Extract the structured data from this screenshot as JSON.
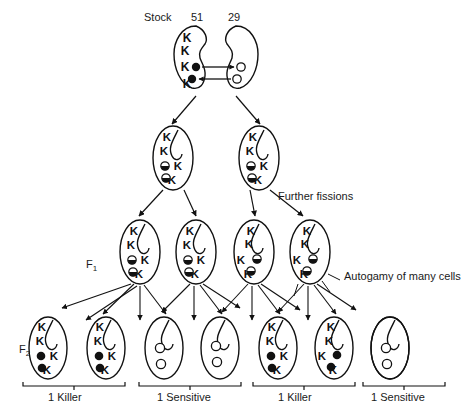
{
  "figure": {
    "type": "genetic-cross-diagram"
  },
  "header": {
    "stock_label": "Stock",
    "stock_left": "51",
    "stock_right": "29"
  },
  "annotations": {
    "further_fissions": "Further fissions",
    "autogamy": "Autogamy of many cells",
    "f1": "F",
    "f1_sub": "1",
    "f2": "F",
    "f2_sub": "2"
  },
  "symbols": {
    "gene": "K",
    "kappa_filled": "filled-circle",
    "kappa_open": "open-circle",
    "kappa_half": "half-filled-circle"
  },
  "generations": [
    {
      "name": "conjugating-pair",
      "row": "stock",
      "cells": [
        {
          "id": "stock-51",
          "side": "left",
          "stock": "51",
          "phenotype": "killer",
          "contents": [
            "K",
            "K",
            "K",
            "filled-circle",
            "filled-circle",
            "K"
          ]
        },
        {
          "id": "stock-29",
          "side": "right",
          "stock": "29",
          "phenotype": "sensitive",
          "contents": [
            "open-circle",
            "open-circle"
          ]
        }
      ],
      "exchange_arrows": [
        {
          "direction": "right",
          "from": "stock-51",
          "to": "stock-29"
        },
        {
          "direction": "left",
          "from": "stock-29",
          "to": "stock-51"
        }
      ]
    },
    {
      "name": "exconjugants",
      "row": "second",
      "cells": [
        {
          "id": "ex-left",
          "contents": [
            "K",
            "K",
            "half-filled-circle",
            "half-filled-circle",
            "K",
            "K"
          ]
        },
        {
          "id": "ex-right",
          "contents": [
            "K",
            "K",
            "half-filled-circle",
            "half-filled-circle",
            "K",
            "K"
          ]
        }
      ]
    },
    {
      "name": "f1",
      "row": "third",
      "cells": [
        {
          "id": "f1-1",
          "contents": [
            "K",
            "K",
            "half-filled-circle",
            "half-filled-circle",
            "K",
            "K"
          ]
        },
        {
          "id": "f1-2",
          "contents": [
            "K",
            "K",
            "half-filled-circle",
            "half-filled-circle",
            "K",
            "K"
          ]
        },
        {
          "id": "f1-3",
          "contents": [
            "K",
            "K",
            "half-filled-circle",
            "K",
            "half-filled-circle",
            "K"
          ]
        },
        {
          "id": "f1-4",
          "contents": [
            "K",
            "K",
            "half-filled-circle",
            "K",
            "half-filled-circle",
            "K"
          ]
        }
      ]
    },
    {
      "name": "f2",
      "row": "bottom",
      "cells": [
        {
          "id": "f2-1",
          "phenotype": "killer",
          "contents": [
            "K",
            "K",
            "filled-circle",
            "filled-circle",
            "K",
            "K"
          ]
        },
        {
          "id": "f2-2",
          "phenotype": "killer",
          "contents": [
            "K",
            "K",
            "filled-circle",
            "filled-circle",
            "K",
            "K"
          ]
        },
        {
          "id": "f2-3",
          "phenotype": "sensitive",
          "contents": [
            "open-circle",
            "open-circle"
          ]
        },
        {
          "id": "f2-4",
          "phenotype": "sensitive",
          "contents": [
            "open-circle",
            "open-circle"
          ]
        },
        {
          "id": "f2-5",
          "phenotype": "killer",
          "contents": [
            "K",
            "K",
            "filled-circle",
            "filled-circle",
            "K",
            "K"
          ]
        },
        {
          "id": "f2-6",
          "phenotype": "killer",
          "contents": [
            "K",
            "K",
            "filled-circle",
            "filled-circle",
            "K",
            "K"
          ]
        },
        {
          "id": "f2-7",
          "phenotype": "sensitive",
          "contents": [
            "open-circle",
            "open-circle"
          ]
        },
        {
          "id": "f2-8",
          "phenotype": "sensitive",
          "contents": [
            "open-circle",
            "open-circle"
          ]
        }
      ]
    }
  ],
  "brackets": [
    {
      "id": "bracket-1",
      "label": "1 Killer"
    },
    {
      "id": "bracket-2",
      "label": "1 Sensitive"
    },
    {
      "id": "bracket-3",
      "label": "1 Killer"
    },
    {
      "id": "bracket-4",
      "label": "1 Sensitive"
    }
  ],
  "colors": {
    "ink": "#111111",
    "background": "#ffffff"
  }
}
